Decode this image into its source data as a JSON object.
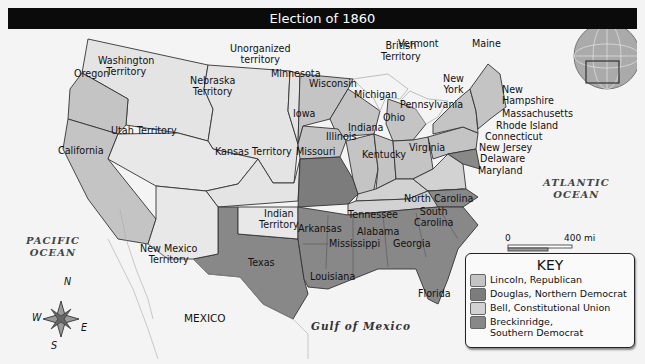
{
  "title": "Election of 1860",
  "colors": {
    "lincoln": "#c4c4c4",
    "douglas": "#7c7c7c",
    "bell": "#d2d2d2",
    "breckinridge": "#888888",
    "territory": "#e6e6e6",
    "ocean": "#f4f4f4",
    "border": "#333333"
  },
  "key": {
    "title": "KEY",
    "items": [
      {
        "label": "Lincoln, Republican",
        "color": "#c4c4c4"
      },
      {
        "label": "Douglas, Northern Democrat",
        "color": "#7c7c7c"
      },
      {
        "label": "Bell, Constitutional Union",
        "color": "#d2d2d2"
      },
      {
        "label": "Breckinridge,",
        "label2": "Southern Democrat",
        "color": "#888888"
      }
    ]
  },
  "labels": {
    "washington_territory": [
      "Washington",
      "Territory"
    ],
    "oregon": "Oregon",
    "california": "California",
    "utah_territory": "Utah Territory",
    "nebraska_territory": [
      "Nebraska",
      "Territory"
    ],
    "unorganized_territory": [
      "Unorganized",
      "territory"
    ],
    "minnesota": "Minnesota",
    "wisconsin": "Wisconsin",
    "michigan": "Michigan",
    "iowa": "Iowa",
    "illinois": "Illinois",
    "indiana": "Indiana",
    "ohio": "Ohio",
    "kansas_territory": "Kansas Territory",
    "missouri": "Missouri",
    "kentucky": "Kentucky",
    "virginia": "Virginia",
    "pennsylvania": "Pennsylvania",
    "new_york": [
      "New",
      "York"
    ],
    "vermont": "Vermont",
    "maine": "Maine",
    "new_hampshire": [
      "New",
      "Hampshire"
    ],
    "massachusetts": "Massachusetts",
    "rhode_island": "Rhode Island",
    "connecticut": "Connecticut",
    "new_jersey": "New Jersey",
    "delaware": "Delaware",
    "maryland": "Maryland",
    "british_territory": [
      "British",
      "Territory"
    ],
    "new_mexico_territory": [
      "New Mexico",
      "Territory"
    ],
    "indian_territory": [
      "Indian",
      "Territory"
    ],
    "texas": "Texas",
    "arkansas": "Arkansas",
    "louisiana": "Louisiana",
    "mississippi": "Mississippi",
    "alabama": "Alabama",
    "georgia": "Georgia",
    "tennessee": "Tennessee",
    "north_carolina": "North Carolina",
    "south_carolina": [
      "South",
      "Carolina"
    ],
    "florida": "Florida",
    "mexico": "MEXICO"
  },
  "water": {
    "pacific": [
      "PACIFIC",
      "OCEAN"
    ],
    "atlantic": [
      "ATLANTIC",
      "OCEAN"
    ],
    "gulf": "Gulf of Mexico"
  },
  "scale": {
    "mi_zero": "0",
    "mi_label": "400 mi",
    "km_zero": "0",
    "km_label": "400 km",
    "projection": [
      "Albers Conic Equal-Area",
      "Projection"
    ]
  },
  "compass": {
    "n": "N",
    "s": "S",
    "e": "E",
    "w": "W"
  }
}
